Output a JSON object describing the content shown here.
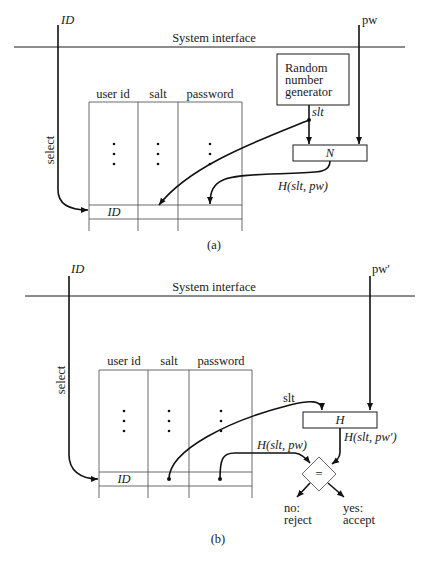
{
  "diagram_a": {
    "caption": "(a)",
    "system_interface_label": "System interface",
    "id_input_label": "ID",
    "pw_input_label": "pw",
    "select_label": "select",
    "table": {
      "columns": [
        "user id",
        "salt",
        "password"
      ],
      "row_ellipsis": "⋮",
      "selected_row_id": "ID"
    },
    "rng_box": {
      "lines": [
        "Random",
        "number",
        "generator"
      ]
    },
    "salt_label": "slt",
    "hash_box_label": "N",
    "hash_output_label": "H(slt, pw)"
  },
  "diagram_b": {
    "caption": "(b)",
    "system_interface_label": "System interface",
    "id_input_label": "ID",
    "pw_input_label": "pw′",
    "select_label": "select",
    "table": {
      "columns": [
        "user id",
        "salt",
        "password"
      ],
      "row_ellipsis": "⋮",
      "selected_row_id": "ID"
    },
    "salt_label": "slt",
    "hash_box_label": "H",
    "stored_hash_label": "H(slt, pw)",
    "computed_hash_label": "H(slt, pw′)",
    "compare_label": "=",
    "no_branch": [
      "no:",
      "reject"
    ],
    "yes_branch": [
      "yes:",
      "accept"
    ]
  }
}
